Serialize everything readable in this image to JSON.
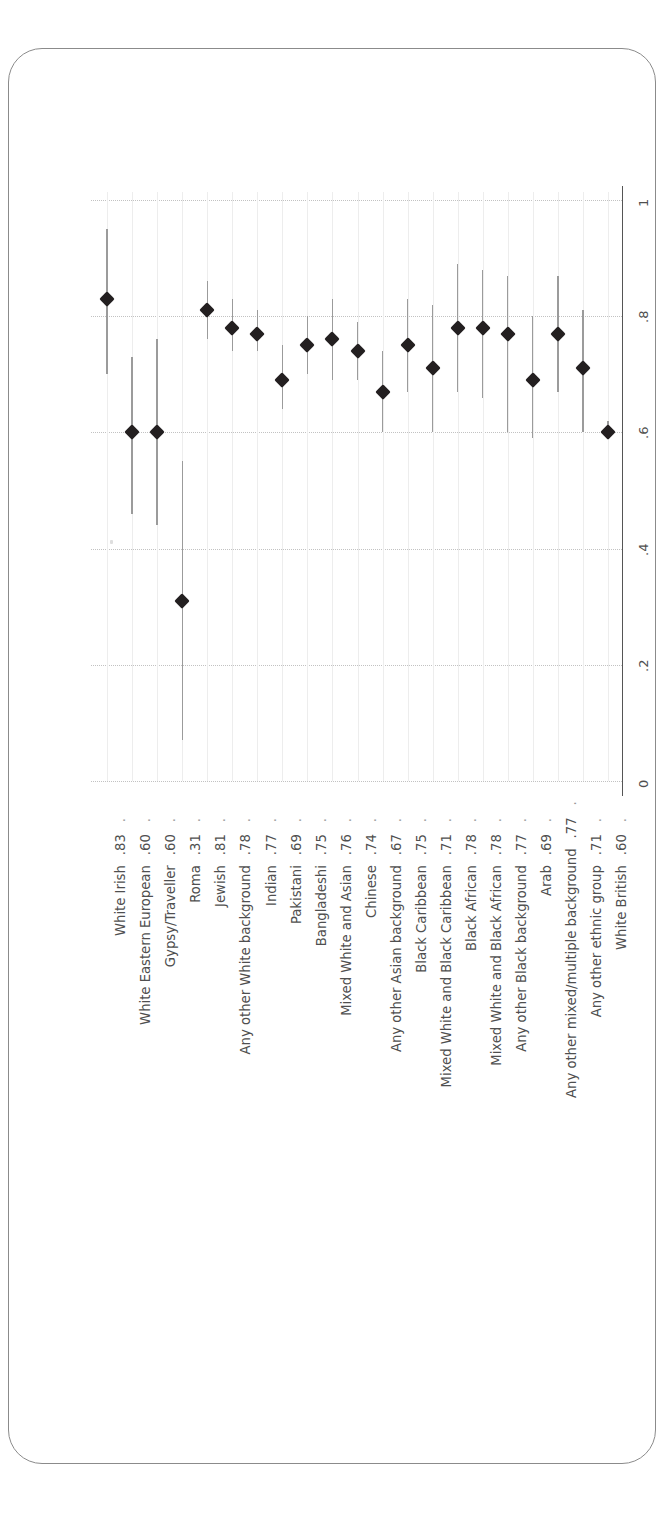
{
  "caption": {
    "text": "FIGURE 9.6: POLITICAL INTEREST, BY ETHNIC GROUP",
    "lead_dot": "•",
    "trail_dot": "•"
  },
  "colors": {
    "marker": "#231f20",
    "ci": "#9b9b9b",
    "grid_major": "#c2c2c2",
    "grid_minor": "#ededed",
    "axis": "#555555",
    "text": "#4f4f4f",
    "caption": "#6d6d6d",
    "card_border": "#8b8b8b"
  },
  "chart_data": {
    "type": "scatter",
    "orientation": "rotated-90",
    "xlabel": "",
    "ylabel": "",
    "ylim": [
      0,
      1
    ],
    "yticks": [
      0,
      0.2,
      0.4,
      0.6,
      0.8,
      1
    ],
    "ytick_labels": [
      "0",
      ".2",
      ".4",
      ".6",
      ".8",
      "1"
    ],
    "grid": true,
    "legend": "none",
    "marker": "diamond",
    "error_bars": "95% confidence interval",
    "categories": [
      "White Irish",
      "White Eastern European",
      "Gypsy/Traveller",
      "Roma",
      "Jewish",
      "Any other White background",
      "Indian",
      "Pakistani",
      "Bangladeshi",
      "Mixed White and Asian",
      "Chinese",
      "Any other Asian background",
      "Black Caribbean",
      "Mixed White and Black Caribbean",
      "Black African",
      "Mixed White and Black African",
      "Any other Black background",
      "Arab",
      "Any other mixed/multiple background",
      "Any other ethnic group",
      "White British"
    ],
    "value_labels": [
      ".83",
      ".60",
      ".60",
      ".31",
      ".81",
      ".78",
      ".77",
      ".69",
      ".75",
      ".76",
      ".74",
      ".67",
      ".75",
      ".71",
      ".78",
      ".78",
      ".77",
      ".69",
      ".77",
      ".71",
      ".60"
    ],
    "values": [
      0.83,
      0.6,
      0.6,
      0.31,
      0.81,
      0.78,
      0.77,
      0.69,
      0.75,
      0.76,
      0.74,
      0.67,
      0.75,
      0.71,
      0.78,
      0.78,
      0.77,
      0.69,
      0.77,
      0.71,
      0.6
    ],
    "ci_low": [
      0.7,
      0.46,
      0.44,
      0.07,
      0.76,
      0.74,
      0.74,
      0.64,
      0.7,
      0.69,
      0.69,
      0.6,
      0.67,
      0.6,
      0.67,
      0.66,
      0.6,
      0.59,
      0.67,
      0.6,
      0.59
    ],
    "ci_high": [
      0.95,
      0.73,
      0.76,
      0.55,
      0.86,
      0.83,
      0.81,
      0.75,
      0.8,
      0.83,
      0.79,
      0.74,
      0.83,
      0.82,
      0.89,
      0.88,
      0.87,
      0.8,
      0.87,
      0.81,
      0.62
    ]
  }
}
